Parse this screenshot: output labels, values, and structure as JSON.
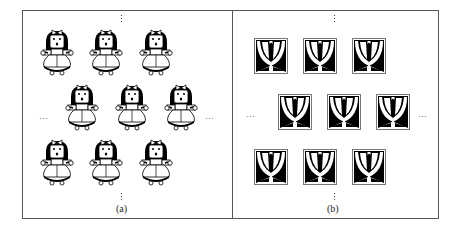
{
  "figure": {
    "panels": [
      {
        "id": "a",
        "caption": "(a)",
        "motif": "doll-figure",
        "rows": [
          3,
          3,
          3
        ],
        "row_offsets": [
          "left",
          "shifted-right",
          "left"
        ],
        "ellipsis_horizontal": "…",
        "ellipsis_vertical": "⋮"
      },
      {
        "id": "b",
        "caption": "(b)",
        "motif": "tulip-tile",
        "rows": [
          3,
          3,
          3
        ],
        "row_offsets": [
          "left",
          "shifted-right",
          "left"
        ],
        "ellipsis_horizontal": "…",
        "ellipsis_vertical": "⋮"
      }
    ],
    "colors": {
      "ink": "#000000",
      "border": "#555555",
      "background": "#ffffff"
    }
  }
}
